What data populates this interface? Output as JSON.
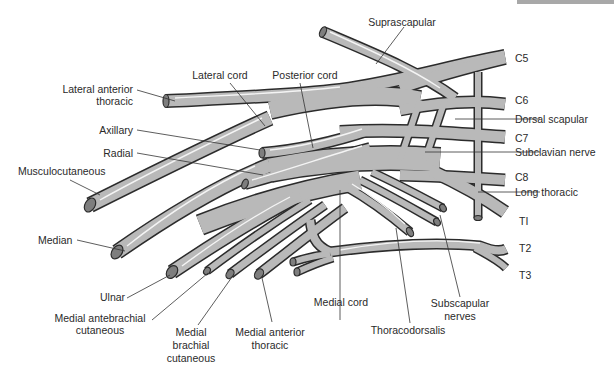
{
  "colors": {
    "nerve_fill": "#b9b9b9",
    "nerve_outline": "#2b2b2b",
    "highlight": "#f4f4f4",
    "label_text": "#2a2a2a",
    "top_bar": "#a8a8a8"
  },
  "roots": [
    {
      "id": "c5",
      "label": "C5"
    },
    {
      "id": "c6",
      "label": "C6"
    },
    {
      "id": "c7",
      "label": "C7"
    },
    {
      "id": "c8",
      "label": "C8"
    },
    {
      "id": "t1",
      "label": "TI"
    },
    {
      "id": "t2",
      "label": "T2"
    },
    {
      "id": "t3",
      "label": "T3"
    }
  ],
  "labels": {
    "suprascapular": "Suprascapular",
    "lateral_cord": "Lateral cord",
    "posterior_cord": "Posterior cord",
    "lateral_anterior_thoracic_1": "Lateral anterior",
    "lateral_anterior_thoracic_2": "thoracic",
    "axillary": "Axillary",
    "radial": "Radial",
    "musculocutaneous": "Musculocutaneous",
    "median": "Median",
    "ulnar": "Ulnar",
    "medial_antebrachial_1": "Medial antebrachial",
    "medial_antebrachial_2": "cutaneous",
    "medial_brachial_1": "Medial",
    "medial_brachial_2": "brachial",
    "medial_brachial_3": "cutaneous",
    "medial_anterior_thoracic_1": "Medial anterior",
    "medial_anterior_thoracic_2": "thoracic",
    "medial_cord": "Medial cord",
    "thoracodorsalis": "Thoracodorsalis",
    "subscapular_1": "Subscapular",
    "subscapular_2": "nerves",
    "dorsal_scapular": "Dorsal scapular",
    "subclavian_nerve": "Subclavian nerve",
    "long_thoracic": "Long thoracic"
  }
}
